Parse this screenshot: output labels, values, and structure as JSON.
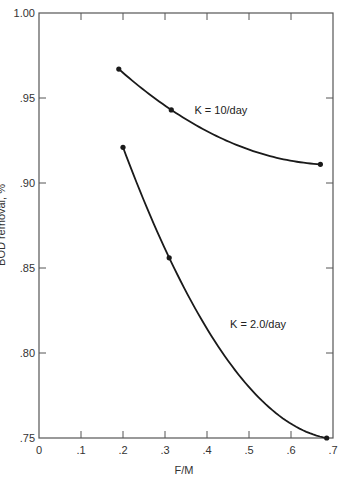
{
  "chart_data": {
    "type": "line",
    "title": "",
    "xlabel": "F/M",
    "ylabel": "BOD removal, %",
    "xlim": [
      0,
      0.7
    ],
    "ylim": [
      0.75,
      1.0
    ],
    "grid": false,
    "legend": "none (inline curve annotations)",
    "x_ticks": [
      0,
      0.1,
      0.2,
      0.3,
      0.4,
      0.5,
      0.6,
      0.7
    ],
    "x_tick_labels": [
      "0",
      ".1",
      ".2",
      ".3",
      ".4",
      ".5",
      ".6",
      ".7"
    ],
    "y_ticks": [
      0.75,
      0.8,
      0.85,
      0.9,
      0.95,
      1.0
    ],
    "y_tick_labels": [
      ".75",
      ".80",
      ".85",
      ".90",
      ".95",
      "1.00"
    ],
    "series": [
      {
        "name": "K = 10/day",
        "x": [
          0.19,
          0.315,
          0.67
        ],
        "values": [
          0.967,
          0.943,
          0.911
        ]
      },
      {
        "name": "K = 2.0/day",
        "x": [
          0.2,
          0.31,
          0.685
        ],
        "values": [
          0.921,
          0.856,
          0.75
        ]
      }
    ],
    "annotations": [
      {
        "text": "K = 10/day",
        "x": 0.37,
        "y": 0.943
      },
      {
        "text": "K = 2.0/day",
        "x": 0.455,
        "y": 0.817
      }
    ]
  },
  "colors": {
    "axis": "#555555",
    "curve": "#1a1a1a",
    "background": "#ffffff"
  }
}
